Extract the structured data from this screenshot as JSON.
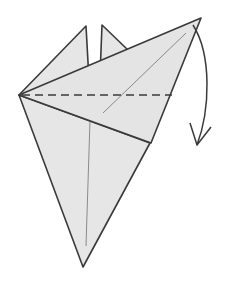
{
  "diagram": {
    "type": "origami-fold-step",
    "colors": {
      "paper": "#e6e6e6",
      "edge": "#3a3a3a",
      "crease": "#8a8a8a",
      "valley_fold": "#3a3a3a",
      "arrow": "#3a3a3a",
      "background": "#ffffff"
    },
    "elements": [
      {
        "name": "back-flap-left",
        "kind": "flap"
      },
      {
        "name": "back-flap-right",
        "kind": "flap"
      },
      {
        "name": "body-kite",
        "kind": "layer"
      },
      {
        "name": "front-flap",
        "kind": "layer"
      },
      {
        "name": "valley-fold-line",
        "kind": "dashed-line"
      },
      {
        "name": "fold-arrow",
        "kind": "curved-arrow",
        "direction": "down"
      }
    ]
  }
}
